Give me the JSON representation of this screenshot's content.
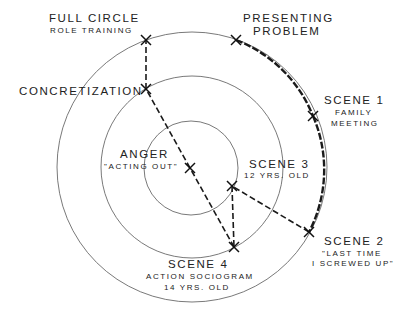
{
  "diagram": {
    "rings": [
      {
        "name": "outer",
        "cx": 192,
        "cy": 167,
        "r": 135
      },
      {
        "name": "middle",
        "cx": 192,
        "cy": 167,
        "r": 91
      },
      {
        "name": "inner",
        "cx": 191,
        "cy": 168,
        "r": 47
      }
    ],
    "nodes": {
      "full_circle": {
        "main": "FULL CIRCLE",
        "sub": [
          "ROLE TRAINING"
        ],
        "x": 146,
        "y": 40
      },
      "presenting_problem": {
        "main": "PRESENTING",
        "sub_main": "PROBLEM",
        "x": 236,
        "y": 40
      },
      "scene1": {
        "main": "SCENE 1",
        "sub": [
          "FAMILY",
          "MEETING"
        ],
        "x": 313,
        "y": 116
      },
      "scene2": {
        "main": "SCENE 2",
        "sub": [
          "\"LAST TIME",
          "I SCREWED UP\""
        ],
        "x": 309,
        "y": 232
      },
      "scene3": {
        "main": "SCENE 3",
        "sub": [
          "12 YRS. OLD"
        ],
        "x": 232,
        "y": 186
      },
      "scene4": {
        "main": "SCENE 4",
        "sub": [
          "ACTION SOCIOGRAM",
          "14 YRS. OLD"
        ],
        "x": 234,
        "y": 247
      },
      "concretization": {
        "main": "CONCRETIZATION",
        "x": 146,
        "y": 89
      },
      "anger": {
        "main": "ANGER",
        "sub": [
          "\"ACTING OUT\""
        ],
        "x": 190,
        "y": 168
      }
    },
    "sequence": [
      "presenting_problem",
      "scene1",
      "scene2",
      "scene3",
      "scene4",
      "anger",
      "concretization",
      "full_circle"
    ]
  }
}
